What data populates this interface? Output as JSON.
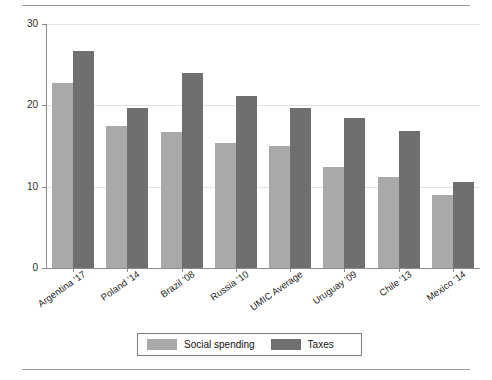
{
  "chart_data": {
    "type": "bar",
    "title": "",
    "subtitle": "",
    "xlabel": "",
    "ylabel": "% of GDP",
    "ylim": [
      0,
      30
    ],
    "yticks": [
      0,
      10,
      20,
      30
    ],
    "ytick_labels": [
      "0",
      "10",
      "20",
      "30"
    ],
    "grid": true,
    "grid_axis": "y",
    "legend_position": "bottom-center",
    "categories": [
      "Argentina '17",
      "Poland '14",
      "Brazil '08",
      "Russia '10",
      "UMIC Average",
      "Uruguay '09",
      "Chile '13",
      "Mexico '14"
    ],
    "series": [
      {
        "name": "Social spending",
        "color": "#a9a9a9",
        "values": [
          22.7,
          17.4,
          16.7,
          15.4,
          15.0,
          12.4,
          11.2,
          9.0
        ]
      },
      {
        "name": "Taxes",
        "color": "#6f6f6f",
        "values": [
          26.7,
          19.7,
          24.0,
          21.1,
          19.7,
          18.4,
          16.8,
          10.6
        ]
      }
    ]
  },
  "legend": {
    "entries": [
      {
        "label": "Social spending",
        "swatch": "light"
      },
      {
        "label": "Taxes",
        "swatch": "dark"
      }
    ]
  },
  "axes": {
    "y_axis_title": "% of GDP"
  }
}
